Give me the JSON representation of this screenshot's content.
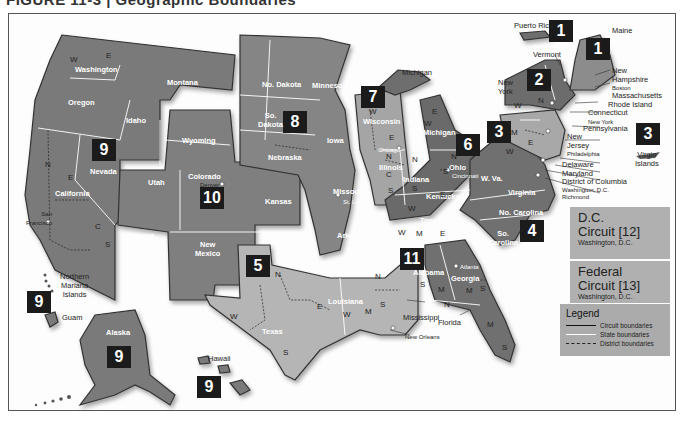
{
  "heading": "FIGURE 11-3 | Geographic Boundaries",
  "colors": {
    "circuit_dark": "#6e6e6e",
    "circuit_mid": "#8a8a8a",
    "circuit_light": "#a9a9a9",
    "badge_bg": "#1b1b1b",
    "box_bg": "#b0b0b0",
    "legend_bg": "#ababab"
  },
  "circuits": [
    {
      "number": "1",
      "members": [
        "Maine",
        "New Hampshire",
        "Massachusetts",
        "Rhode Island",
        "Puerto Rico"
      ]
    },
    {
      "number": "2",
      "members": [
        "Vermont",
        "New York",
        "Connecticut"
      ]
    },
    {
      "number": "3",
      "members": [
        "Pennsylvania",
        "New Jersey",
        "Delaware",
        "Virgin Islands"
      ]
    },
    {
      "number": "4",
      "members": [
        "Maryland",
        "W. Va.",
        "Virginia",
        "No. Carolina",
        "So. Carolina"
      ]
    },
    {
      "number": "5",
      "members": [
        "Texas",
        "Louisiana",
        "Mississippi"
      ]
    },
    {
      "number": "6",
      "members": [
        "Michigan",
        "Ohio",
        "Kentucky",
        "Tennessee"
      ]
    },
    {
      "number": "7",
      "members": [
        "Wisconsin",
        "Illinois",
        "Indiana"
      ]
    },
    {
      "number": "8",
      "members": [
        "No. Dakota",
        "So. Dakota",
        "Nebraska",
        "Minnesota",
        "Iowa",
        "Missouri",
        "Arkansas"
      ]
    },
    {
      "number": "9",
      "members": [
        "Washington",
        "Oregon",
        "Idaho",
        "Montana",
        "Nevada",
        "California",
        "Arizona",
        "Alaska",
        "Hawaii",
        "Guam",
        "Northern Mariana Islands"
      ]
    },
    {
      "number": "10",
      "members": [
        "Wyoming",
        "Utah",
        "Colorado",
        "Kansas",
        "Oklahoma",
        "New Mexico"
      ]
    },
    {
      "number": "11",
      "members": [
        "Alabama",
        "Georgia",
        "Florida"
      ]
    }
  ],
  "badges": {
    "b1_pr": "1",
    "b1_me": "1",
    "b2": "2",
    "b3_pa": "3",
    "b3_vi": "3",
    "b4": "4",
    "b5": "5",
    "b6": "6",
    "b7": "7",
    "b8": "8",
    "b9_nv": "9",
    "b9_mi": "9",
    "b9_ak": "9",
    "b9_hi": "9",
    "b10": "10",
    "b11": "11"
  },
  "state_labels": {
    "washington": "Washington",
    "oregon": "Oregon",
    "idaho": "Idaho",
    "montana": "Montana",
    "nevada": "Nevada",
    "california": "California",
    "arizona": "Arizona",
    "wyoming": "Wyoming",
    "utah": "Utah",
    "colorado": "Colorado",
    "kansas": "Kansas",
    "new_mexico": "New\nMexico",
    "oklahoma": "Oklahoma",
    "no_dakota": "No. Dakota",
    "so_dakota": "So.\nDakota",
    "nebraska": "Nebraska",
    "minnesota": "Minnesota",
    "iowa": "Iowa",
    "missouri": "Missouri",
    "arkansas": "Arkansas",
    "texas": "Texas",
    "louisiana": "Louisiana",
    "wisconsin": "Wisconsin",
    "illinois": "Illinois",
    "indiana": "Indiana",
    "michigan": "Michigan",
    "ohio": "Ohio",
    "kentucky": "Kentucky",
    "tennessee": "Tennessee",
    "alabama": "Alabama",
    "georgia": "Georgia",
    "w_va": "W. Va.",
    "virginia": "Virginia",
    "no_carolina": "No. Carolina",
    "so_carolina": "So.\nCarolina",
    "alaska": "Alaska"
  },
  "callout_labels": {
    "puerto_rico": "Puerto Rico",
    "maine": "Maine",
    "vermont": "Vermont",
    "new_york": "New\nYork",
    "new_hampshire": "New\nHampshire",
    "boston": "Boston",
    "massachusetts": "Massachusetts",
    "rhode_island": "Rhode Island",
    "connecticut": "Connecticut",
    "new_york_city": "New York",
    "pennsylvania": "Pennsylvania",
    "new_jersey": "New\nJersey",
    "philadelphia": "Philadelphia",
    "delaware": "Delaware",
    "maryland": "Maryland",
    "dc": "District of Columbia",
    "washington_dc": "Washington, D.C.",
    "richmond": "Richmond",
    "virgin_islands": "Virgin\nIslands",
    "michigan_up": "Michigan",
    "mississippi": "Mississippi",
    "new_orleans": "New Orleans",
    "florida": "Florida",
    "hawaii": "Hawaii",
    "guam": "Guam",
    "northern_mariana": "Northern\nMariana\nIslands",
    "san_francisco": "San\nFrancisco",
    "denver": "Denver",
    "st_louis": "St. Louis",
    "chicago": "Chicago",
    "cincinnati": "Cincinnati",
    "atlanta": "Atlanta"
  },
  "district_letters": [
    "W",
    "E",
    "N",
    "C",
    "S",
    "M"
  ],
  "special_circuits": [
    {
      "title": "D.C.\nCircuit [12]",
      "subtitle": "Washington, D.C."
    },
    {
      "title": "Federal\nCircuit [13]",
      "subtitle": "Washington, D.C."
    }
  ],
  "legend": {
    "title": "Legend",
    "items": [
      {
        "label": "Circuit boundaries",
        "style": "solid-dark"
      },
      {
        "label": "State boundaries",
        "style": "solid-white"
      },
      {
        "label": "District boundaries",
        "style": "dashed"
      }
    ]
  }
}
